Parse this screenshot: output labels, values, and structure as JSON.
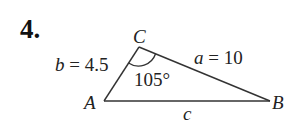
{
  "problem": {
    "number": "4."
  },
  "triangle": {
    "vertices": {
      "A": {
        "label": "A",
        "x": 104,
        "y": 101
      },
      "B": {
        "label": "B",
        "x": 270,
        "y": 101
      },
      "C": {
        "label": "C",
        "x": 139,
        "y": 47
      }
    },
    "sides": {
      "b": {
        "var": "b",
        "eq": " = 4.5"
      },
      "a": {
        "var": "a",
        "eq": " = 10"
      },
      "c": {
        "var": "c"
      }
    },
    "angle_C": "105°"
  },
  "colors": {
    "line": "#333333",
    "text": "#222222"
  }
}
